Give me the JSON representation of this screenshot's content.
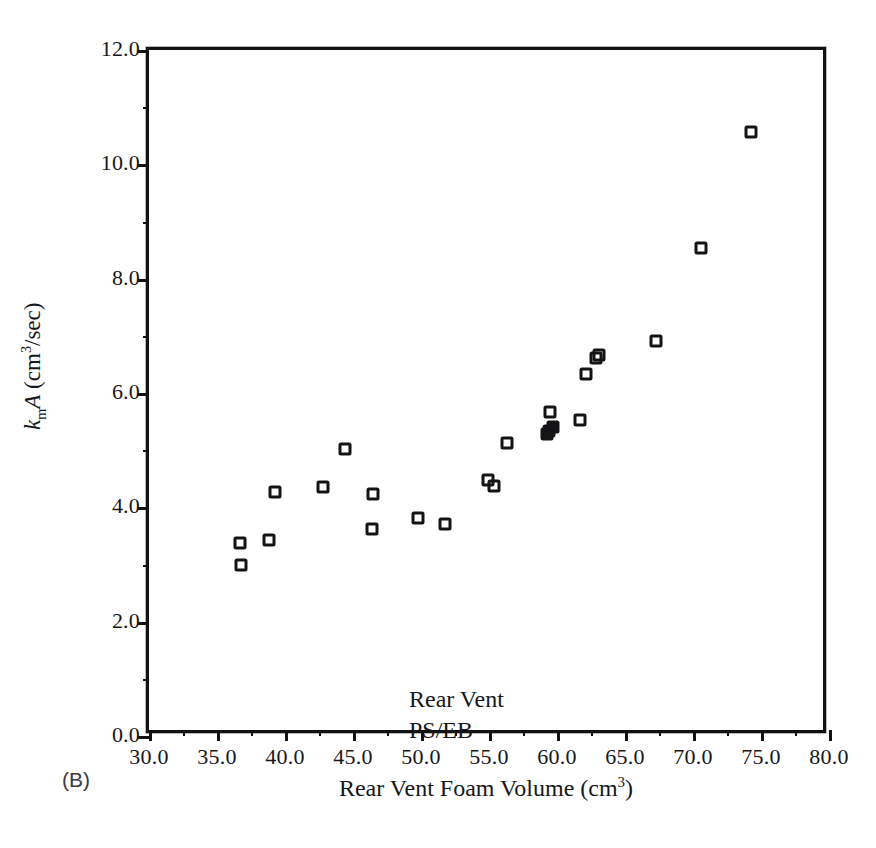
{
  "scan_artifact_text": "•••••••••••••••",
  "panel_label": "(B)",
  "annotation": {
    "line1": "Rear Vent",
    "line2": "PS/EB"
  },
  "axes": {
    "x_title_main": "Rear Vent Foam Volume (cm",
    "x_title_sup": "3",
    "x_title_tail": ")",
    "y_title_k": "k",
    "y_title_sub": "m",
    "y_title_A": "A",
    "y_title_unit_open": " (cm",
    "y_title_sup": "3",
    "y_title_unit_close": "/sec)"
  },
  "chart_data": {
    "type": "scatter",
    "title": "",
    "subtitle": "",
    "annotation_text": "Rear Vent PS/EB",
    "panel": "(B)",
    "xlabel": "Rear Vent Foam Volume (cm^3)",
    "ylabel": "k_m A (cm^3/sec)",
    "xlim": [
      30.0,
      80.0
    ],
    "ylim": [
      0.0,
      12.0
    ],
    "xticks": [
      30.0,
      35.0,
      40.0,
      45.0,
      50.0,
      55.0,
      60.0,
      65.0,
      70.0,
      75.0,
      80.0
    ],
    "yticks": [
      0.0,
      2.0,
      4.0,
      6.0,
      8.0,
      10.0,
      12.0
    ],
    "xtick_labels": [
      "30.0",
      "35.0",
      "40.0",
      "45.0",
      "50.0",
      "55.0",
      "60.0",
      "65.0",
      "70.0",
      "75.0",
      "80.0"
    ],
    "ytick_labels": [
      "0.0",
      "2.0",
      "4.0",
      "6.0",
      "8.0",
      "10.0",
      "12.0"
    ],
    "grid": false,
    "legend": null,
    "marker": "open-square",
    "series": [
      {
        "name": "Rear Vent PS/EB",
        "points": [
          {
            "x": 36.7,
            "y": 3.38,
            "filled": false
          },
          {
            "x": 36.8,
            "y": 3.0,
            "filled": false
          },
          {
            "x": 38.8,
            "y": 3.43,
            "filled": false
          },
          {
            "x": 39.3,
            "y": 4.27,
            "filled": false
          },
          {
            "x": 42.8,
            "y": 4.36,
            "filled": false
          },
          {
            "x": 44.4,
            "y": 5.02,
            "filled": false
          },
          {
            "x": 46.5,
            "y": 4.23,
            "filled": false
          },
          {
            "x": 46.4,
            "y": 3.62,
            "filled": false
          },
          {
            "x": 49.8,
            "y": 3.82,
            "filled": false
          },
          {
            "x": 51.8,
            "y": 3.7,
            "filled": false
          },
          {
            "x": 54.9,
            "y": 4.48,
            "filled": false
          },
          {
            "x": 55.4,
            "y": 4.38,
            "filled": false
          },
          {
            "x": 56.3,
            "y": 5.12,
            "filled": false
          },
          {
            "x": 59.5,
            "y": 5.66,
            "filled": false
          },
          {
            "x": 59.4,
            "y": 5.34,
            "filled": true
          },
          {
            "x": 59.7,
            "y": 5.4,
            "filled": true
          },
          {
            "x": 59.3,
            "y": 5.28,
            "filled": true
          },
          {
            "x": 61.7,
            "y": 5.53,
            "filled": false
          },
          {
            "x": 62.1,
            "y": 6.33,
            "filled": false
          },
          {
            "x": 62.9,
            "y": 6.62,
            "filled": false
          },
          {
            "x": 63.1,
            "y": 6.67,
            "filled": false
          },
          {
            "x": 67.3,
            "y": 6.91,
            "filled": false
          },
          {
            "x": 70.6,
            "y": 8.53,
            "filled": false
          },
          {
            "x": 74.3,
            "y": 10.57,
            "filled": false
          }
        ]
      }
    ]
  }
}
